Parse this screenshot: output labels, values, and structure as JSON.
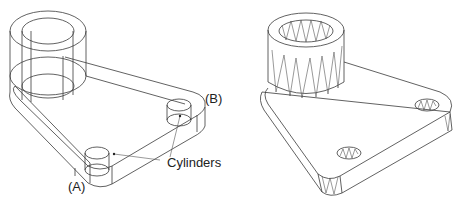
{
  "figure": {
    "left_view": {
      "style": "wireframe",
      "labels": {
        "a": "(A)",
        "b": "(B)",
        "cylinders": "Cylinders"
      }
    },
    "right_view": {
      "style": "tessellated-mesh"
    },
    "colors": {
      "stroke": "#3a3a3a",
      "background": "#ffffff"
    }
  }
}
